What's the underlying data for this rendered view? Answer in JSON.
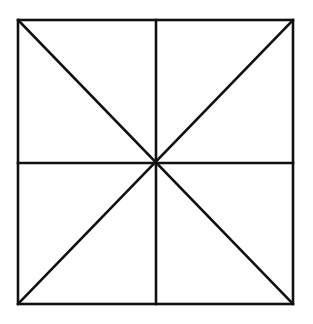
{
  "diagram": {
    "stroke_color": "#111111",
    "background_color": "#ffffff",
    "square": {
      "x1": 18,
      "y1": 20,
      "x2": 293,
      "y2": 304
    },
    "center": {
      "x": 156,
      "y": 163
    },
    "lines": [
      {
        "id": "diagonal-tl-br",
        "x1": 18,
        "y1": 20,
        "x2": 293,
        "y2": 304
      },
      {
        "id": "diagonal-tr-bl",
        "x1": 293,
        "y1": 20,
        "x2": 18,
        "y2": 304
      },
      {
        "id": "vertical-midline",
        "x1": 156,
        "y1": 20,
        "x2": 156,
        "y2": 304
      },
      {
        "id": "horizontal-midline",
        "x1": 18,
        "y1": 163,
        "x2": 293,
        "y2": 163
      }
    ],
    "region_count": 8
  }
}
